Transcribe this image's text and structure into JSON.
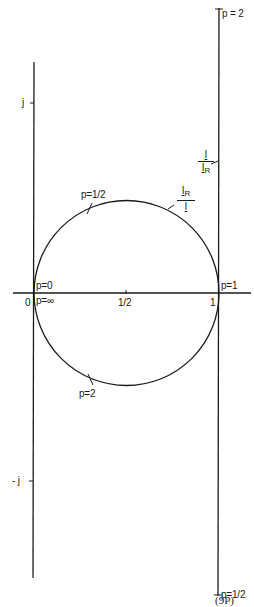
{
  "diagram": {
    "type": "complex-plane circle diagram",
    "figure_number": "(9P)",
    "axes": {
      "real_axis": {
        "ticks": [
          {
            "label": "0",
            "value": 0
          },
          {
            "label": "1/2",
            "value": 0.5
          },
          {
            "label": "1",
            "value": 1
          }
        ]
      },
      "imag_axis": {
        "ticks": [
          {
            "label": "j",
            "value": 1
          },
          {
            "label": "- j",
            "value": -1
          }
        ]
      }
    },
    "circle": {
      "center": [
        0.5,
        0
      ],
      "radius": 0.5,
      "curve_label": {
        "numerator": "I",
        "numerator_sub": "R",
        "denominator": "I"
      },
      "point_labels": [
        {
          "label": "p=0",
          "position": "origin-upper"
        },
        {
          "label": "p=∞",
          "position": "origin-lower"
        },
        {
          "label": "p=1/2",
          "position": "upper-arc"
        },
        {
          "label": "p=2",
          "position": "lower-arc"
        },
        {
          "label": "p=1",
          "position": "real-1"
        }
      ]
    },
    "line": {
      "x": 1,
      "curve_label": {
        "numerator": "I",
        "denominator": "I",
        "denominator_sub": "R"
      },
      "point_labels": [
        {
          "label": "p = 2",
          "position": "top"
        },
        {
          "label": "p=1/2",
          "position": "bottom"
        }
      ]
    }
  }
}
